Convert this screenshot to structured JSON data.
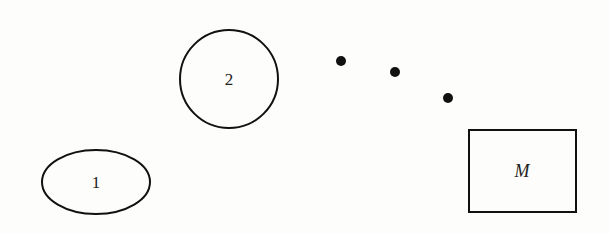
{
  "diagram": {
    "nodes": [
      {
        "id": "node-1",
        "shape": "ellipse",
        "label": "1",
        "cx": 96,
        "cy": 182,
        "rx": 54,
        "ry": 32
      },
      {
        "id": "node-2",
        "shape": "circle",
        "label": "2",
        "cx": 229,
        "cy": 79,
        "r": 49
      },
      {
        "id": "node-M",
        "shape": "rectangle",
        "label": "M",
        "x": 469,
        "y": 130,
        "width": 107,
        "height": 82
      }
    ],
    "ellipsis_dots": [
      {
        "cx": 341,
        "cy": 61,
        "r": 5
      },
      {
        "cx": 395,
        "cy": 72,
        "r": 5
      },
      {
        "cx": 448,
        "cy": 98,
        "r": 5
      }
    ],
    "colors": {
      "stroke": "#111111",
      "background": "#fdfdfb",
      "text": "#222222"
    }
  }
}
